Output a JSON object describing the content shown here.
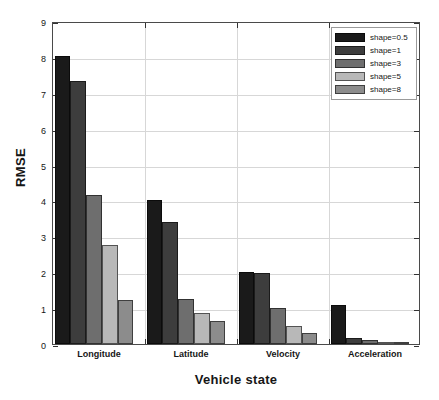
{
  "chart_data": {
    "type": "bar",
    "title": "",
    "xlabel": "Vehicle state",
    "ylabel": "RMSE",
    "categories": [
      "Longitude",
      "Latitude",
      "Velocity",
      "Acceleration"
    ],
    "series": [
      {
        "name": "shape=0.5",
        "color": "#1a1a1a",
        "values": [
          8.02,
          4.0,
          2.01,
          1.08
        ]
      },
      {
        "name": "shape=1",
        "color": "#3d3d3d",
        "values": [
          7.34,
          3.41,
          1.97,
          0.16
        ]
      },
      {
        "name": "shape=3",
        "color": "#6e6e6e",
        "values": [
          4.15,
          1.25,
          1.0,
          0.11
        ]
      },
      {
        "name": "shape=5",
        "color": "#b8b8b8",
        "values": [
          2.77,
          0.87,
          0.51,
          0.04
        ]
      },
      {
        "name": "shape=8",
        "color": "#8c8c8c",
        "values": [
          1.22,
          0.65,
          0.3,
          0.03
        ]
      }
    ],
    "ylim": [
      0,
      9
    ],
    "yticks": [
      0,
      1,
      2,
      3,
      4,
      5,
      6,
      7,
      8,
      9
    ],
    "ytick_labels": [
      "0",
      "1",
      "2",
      "3",
      "4",
      "5",
      "6",
      "7",
      "8",
      "9"
    ],
    "grid": true,
    "legend_position": "top-right"
  }
}
